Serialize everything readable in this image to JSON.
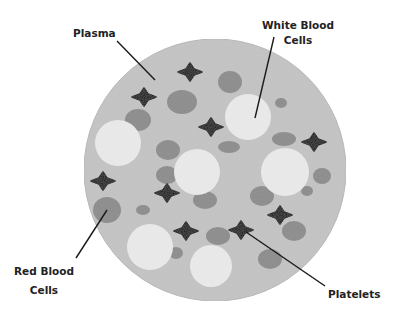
{
  "diagram": {
    "colors": {
      "background": "#ffffff",
      "plasma": "#c4c4c4",
      "plasma_edge": "#b8b8b8",
      "white_blood_cell": "#ececec",
      "red_blood_cell": "#8a8a8a",
      "platelet": "#050505",
      "leader_line": "#1a1a1a",
      "text": "#222222"
    },
    "plasma_circle": {
      "cx": 215,
      "cy": 170,
      "r": 131
    },
    "labels": {
      "plasma": {
        "lines": [
          "Plasma"
        ]
      },
      "white_blood_cells": {
        "lines": [
          "White Blood",
          "Cells"
        ]
      },
      "red_blood_cells": {
        "lines": [
          "Red Blood",
          "Cells"
        ]
      },
      "platelets": {
        "lines": [
          "Platelets"
        ]
      }
    },
    "white_blood_cells": [
      {
        "cx": 118,
        "cy": 143,
        "r": 23
      },
      {
        "cx": 248,
        "cy": 117,
        "r": 23
      },
      {
        "cx": 197,
        "cy": 172,
        "r": 23
      },
      {
        "cx": 285,
        "cy": 172,
        "r": 24
      },
      {
        "cx": 150,
        "cy": 247,
        "r": 23
      },
      {
        "cx": 211,
        "cy": 266,
        "r": 21
      }
    ],
    "red_blood_cells": [
      {
        "cx": 182,
        "cy": 102,
        "rx": 15,
        "ry": 12
      },
      {
        "cx": 138,
        "cy": 120,
        "rx": 13,
        "ry": 11
      },
      {
        "cx": 230,
        "cy": 82,
        "rx": 12,
        "ry": 11
      },
      {
        "cx": 168,
        "cy": 150,
        "rx": 12,
        "ry": 10
      },
      {
        "cx": 281,
        "cy": 103,
        "rx": 6,
        "ry": 5
      },
      {
        "cx": 284,
        "cy": 139,
        "rx": 12,
        "ry": 7
      },
      {
        "cx": 229,
        "cy": 147,
        "rx": 11,
        "ry": 6
      },
      {
        "cx": 107,
        "cy": 210,
        "rx": 14,
        "ry": 13
      },
      {
        "cx": 143,
        "cy": 210,
        "rx": 7,
        "ry": 5
      },
      {
        "cx": 167,
        "cy": 175,
        "rx": 11,
        "ry": 9
      },
      {
        "cx": 262,
        "cy": 196,
        "rx": 12,
        "ry": 10
      },
      {
        "cx": 307,
        "cy": 191,
        "rx": 6,
        "ry": 5
      },
      {
        "cx": 322,
        "cy": 176,
        "rx": 9,
        "ry": 8
      },
      {
        "cx": 218,
        "cy": 236,
        "rx": 12,
        "ry": 9
      },
      {
        "cx": 294,
        "cy": 231,
        "rx": 12,
        "ry": 10
      },
      {
        "cx": 176,
        "cy": 253,
        "rx": 7,
        "ry": 6
      },
      {
        "cx": 270,
        "cy": 259,
        "rx": 12,
        "ry": 10
      },
      {
        "cx": 205,
        "cy": 200,
        "rx": 12,
        "ry": 9
      }
    ],
    "platelets": [
      {
        "cx": 190,
        "cy": 72
      },
      {
        "cx": 144,
        "cy": 97
      },
      {
        "cx": 211,
        "cy": 127
      },
      {
        "cx": 314,
        "cy": 142
      },
      {
        "cx": 103,
        "cy": 181
      },
      {
        "cx": 167,
        "cy": 193
      },
      {
        "cx": 280,
        "cy": 215
      },
      {
        "cx": 241,
        "cy": 230
      },
      {
        "cx": 186,
        "cy": 231
      }
    ],
    "leader_lines": {
      "plasma": {
        "x1": 117,
        "y1": 41,
        "x2": 155,
        "y2": 80
      },
      "white_blood_cells": {
        "x1": 274,
        "y1": 37,
        "x2": 255,
        "y2": 118
      },
      "red_blood_cells": {
        "x1": 76,
        "y1": 258,
        "x2": 107,
        "y2": 210
      },
      "platelets": {
        "x1": 246,
        "y1": 232,
        "x2": 325,
        "y2": 286
      }
    }
  }
}
